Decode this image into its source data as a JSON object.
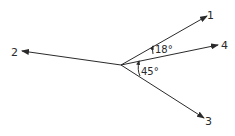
{
  "diagram": {
    "type": "force-vector-diagram",
    "origin": {
      "x": 121,
      "y": 65
    },
    "vectors": [
      {
        "id": "1",
        "label": "1",
        "tip": {
          "x": 207,
          "y": 16
        },
        "label_pos": {
          "x": 210,
          "y": 19
        }
      },
      {
        "id": "2",
        "label": "2",
        "tip": {
          "x": 22,
          "y": 51
        },
        "label_pos": {
          "x": 12,
          "y": 56
        }
      },
      {
        "id": "3",
        "label": "3",
        "tip": {
          "x": 204,
          "y": 118
        },
        "label_pos": {
          "x": 205,
          "y": 125
        }
      },
      {
        "id": "4",
        "label": "4",
        "tip": {
          "x": 218,
          "y": 45
        },
        "label_pos": {
          "x": 221,
          "y": 49
        }
      }
    ],
    "angles": [
      {
        "label": "18°",
        "between": [
          "1",
          "4"
        ],
        "label_pos": {
          "x": 158,
          "y": 53
        }
      },
      {
        "label": "45°",
        "between": [
          "4",
          "3"
        ],
        "label_pos": {
          "x": 140,
          "y": 75
        }
      }
    ],
    "line_color": "#2a2a2a"
  }
}
